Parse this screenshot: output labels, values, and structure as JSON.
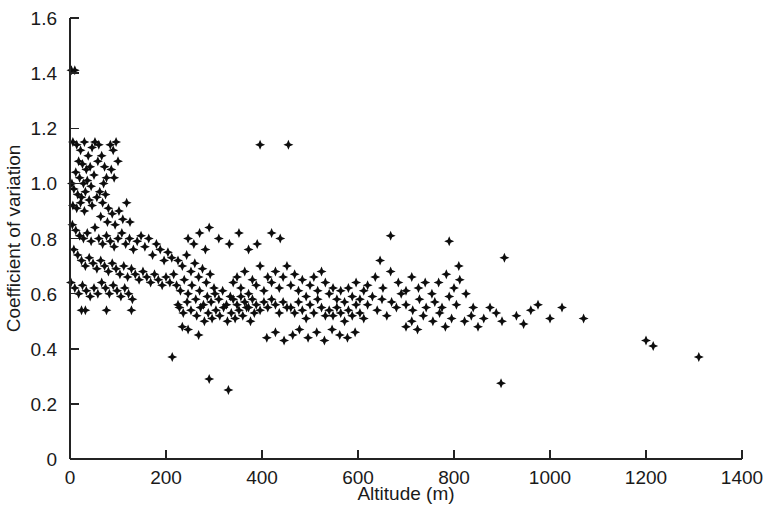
{
  "chart_data": {
    "type": "scatter",
    "title": "",
    "xlabel": "Altitude (m)",
    "ylabel": "Coefficient of variation",
    "xlim": [
      0,
      1400
    ],
    "ylim": [
      0,
      1.6
    ],
    "xticks": [
      0,
      200,
      400,
      600,
      800,
      1000,
      1200,
      1400
    ],
    "xtick_labels": [
      "0",
      "200",
      "400",
      "600",
      "800",
      "1000",
      "1200",
      "1400"
    ],
    "yticks": [
      0,
      0.2,
      0.4,
      0.6,
      0.8,
      1.0,
      1.2,
      1.4,
      1.6
    ],
    "ytick_labels": [
      "0",
      "0.2",
      "0.4",
      "0.6",
      "0.8",
      "1.0",
      "1.2",
      "1.4",
      "1.6"
    ],
    "grid": false,
    "legend": null,
    "marker": "diamond",
    "marker_color": "#0d0d0d",
    "marker_size": 9,
    "n_points": 330,
    "points": [
      [
        3,
        1.41
      ],
      [
        10,
        1.41
      ],
      [
        6,
        1.15
      ],
      [
        14,
        1.14
      ],
      [
        22,
        1.12
      ],
      [
        30,
        1.15
      ],
      [
        38,
        1.1
      ],
      [
        46,
        1.13
      ],
      [
        52,
        1.15
      ],
      [
        60,
        1.14
      ],
      [
        18,
        1.08
      ],
      [
        26,
        1.07
      ],
      [
        34,
        1.05
      ],
      [
        42,
        1.06
      ],
      [
        12,
        1.04
      ],
      [
        20,
        1.02
      ],
      [
        28,
        1.0
      ],
      [
        36,
        1.01
      ],
      [
        44,
        0.99
      ],
      [
        50,
        1.03
      ],
      [
        4,
        1.0
      ],
      [
        8,
        0.98
      ],
      [
        16,
        0.96
      ],
      [
        24,
        0.95
      ],
      [
        32,
        0.97
      ],
      [
        40,
        0.94
      ],
      [
        6,
        0.92
      ],
      [
        14,
        0.91
      ],
      [
        22,
        0.93
      ],
      [
        30,
        0.9
      ],
      [
        46,
        0.92
      ],
      [
        56,
        0.95
      ],
      [
        62,
        0.97
      ],
      [
        68,
        0.93
      ],
      [
        74,
        0.96
      ],
      [
        80,
        0.91
      ],
      [
        70,
        1.0
      ],
      [
        76,
        1.02
      ],
      [
        58,
        1.08
      ],
      [
        66,
        1.1
      ],
      [
        72,
        1.06
      ],
      [
        84,
        1.14
      ],
      [
        90,
        1.12
      ],
      [
        96,
        1.15
      ],
      [
        86,
        1.05
      ],
      [
        92,
        1.02
      ],
      [
        100,
        1.08
      ],
      [
        64,
        0.88
      ],
      [
        78,
        0.86
      ],
      [
        88,
        0.89
      ],
      [
        94,
        0.85
      ],
      [
        102,
        0.9
      ],
      [
        110,
        0.87
      ],
      [
        118,
        0.93
      ],
      [
        125,
        0.86
      ],
      [
        5,
        0.85
      ],
      [
        12,
        0.83
      ],
      [
        20,
        0.81
      ],
      [
        28,
        0.8
      ],
      [
        36,
        0.82
      ],
      [
        44,
        0.79
      ],
      [
        52,
        0.84
      ],
      [
        60,
        0.8
      ],
      [
        68,
        0.78
      ],
      [
        76,
        0.81
      ],
      [
        84,
        0.79
      ],
      [
        92,
        0.77
      ],
      [
        100,
        0.8
      ],
      [
        108,
        0.82
      ],
      [
        116,
        0.78
      ],
      [
        124,
        0.8
      ],
      [
        132,
        0.76
      ],
      [
        140,
        0.79
      ],
      [
        148,
        0.81
      ],
      [
        156,
        0.77
      ],
      [
        164,
        0.8
      ],
      [
        172,
        0.74
      ],
      [
        180,
        0.78
      ],
      [
        188,
        0.76
      ],
      [
        196,
        0.72
      ],
      [
        204,
        0.75
      ],
      [
        212,
        0.73
      ],
      [
        8,
        0.76
      ],
      [
        16,
        0.74
      ],
      [
        24,
        0.72
      ],
      [
        32,
        0.7
      ],
      [
        40,
        0.73
      ],
      [
        48,
        0.71
      ],
      [
        56,
        0.69
      ],
      [
        64,
        0.72
      ],
      [
        72,
        0.7
      ],
      [
        80,
        0.68
      ],
      [
        88,
        0.71
      ],
      [
        96,
        0.69
      ],
      [
        104,
        0.67
      ],
      [
        112,
        0.7
      ],
      [
        120,
        0.66
      ],
      [
        128,
        0.69
      ],
      [
        136,
        0.67
      ],
      [
        144,
        0.65
      ],
      [
        152,
        0.68
      ],
      [
        160,
        0.66
      ],
      [
        168,
        0.64
      ],
      [
        176,
        0.67
      ],
      [
        184,
        0.65
      ],
      [
        192,
        0.63
      ],
      [
        200,
        0.66
      ],
      [
        208,
        0.64
      ],
      [
        216,
        0.67
      ],
      [
        2,
        0.64
      ],
      [
        10,
        0.62
      ],
      [
        18,
        0.6
      ],
      [
        26,
        0.63
      ],
      [
        34,
        0.61
      ],
      [
        42,
        0.59
      ],
      [
        50,
        0.62
      ],
      [
        58,
        0.6
      ],
      [
        66,
        0.64
      ],
      [
        74,
        0.62
      ],
      [
        82,
        0.6
      ],
      [
        90,
        0.63
      ],
      [
        98,
        0.61
      ],
      [
        106,
        0.59
      ],
      [
        114,
        0.62
      ],
      [
        122,
        0.6
      ],
      [
        130,
        0.58
      ],
      [
        24,
        0.54
      ],
      [
        32,
        0.54
      ],
      [
        76,
        0.54
      ],
      [
        128,
        0.54
      ],
      [
        213,
        0.37
      ],
      [
        225,
        0.72
      ],
      [
        234,
        0.7
      ],
      [
        243,
        0.74
      ],
      [
        252,
        0.68
      ],
      [
        260,
        0.71
      ],
      [
        268,
        0.66
      ],
      [
        276,
        0.69
      ],
      [
        284,
        0.64
      ],
      [
        292,
        0.67
      ],
      [
        300,
        0.62
      ],
      [
        222,
        0.63
      ],
      [
        230,
        0.61
      ],
      [
        238,
        0.65
      ],
      [
        246,
        0.6
      ],
      [
        254,
        0.63
      ],
      [
        262,
        0.58
      ],
      [
        270,
        0.61
      ],
      [
        278,
        0.56
      ],
      [
        286,
        0.59
      ],
      [
        294,
        0.57
      ],
      [
        302,
        0.6
      ],
      [
        310,
        0.58
      ],
      [
        318,
        0.61
      ],
      [
        326,
        0.56
      ],
      [
        334,
        0.59
      ],
      [
        228,
        0.55
      ],
      [
        236,
        0.53
      ],
      [
        244,
        0.57
      ],
      [
        252,
        0.54
      ],
      [
        264,
        0.52
      ],
      [
        272,
        0.55
      ],
      [
        280,
        0.5
      ],
      [
        288,
        0.53
      ],
      [
        296,
        0.51
      ],
      [
        304,
        0.54
      ],
      [
        312,
        0.52
      ],
      [
        320,
        0.55
      ],
      [
        328,
        0.5
      ],
      [
        336,
        0.53
      ],
      [
        344,
        0.51
      ],
      [
        352,
        0.54
      ],
      [
        360,
        0.52
      ],
      [
        368,
        0.55
      ],
      [
        376,
        0.5
      ],
      [
        384,
        0.53
      ],
      [
        340,
        0.64
      ],
      [
        348,
        0.66
      ],
      [
        356,
        0.62
      ],
      [
        364,
        0.68
      ],
      [
        372,
        0.6
      ],
      [
        380,
        0.65
      ],
      [
        388,
        0.63
      ],
      [
        396,
        0.7
      ],
      [
        404,
        0.61
      ],
      [
        412,
        0.66
      ],
      [
        340,
        0.58
      ],
      [
        348,
        0.56
      ],
      [
        356,
        0.59
      ],
      [
        364,
        0.57
      ],
      [
        372,
        0.55
      ],
      [
        380,
        0.58
      ],
      [
        388,
        0.56
      ],
      [
        396,
        0.54
      ],
      [
        404,
        0.57
      ],
      [
        412,
        0.55
      ],
      [
        420,
        0.58
      ],
      [
        428,
        0.56
      ],
      [
        436,
        0.53
      ],
      [
        444,
        0.57
      ],
      [
        452,
        0.55
      ],
      [
        420,
        0.64
      ],
      [
        428,
        0.68
      ],
      [
        436,
        0.62
      ],
      [
        444,
        0.66
      ],
      [
        452,
        0.7
      ],
      [
        460,
        0.63
      ],
      [
        468,
        0.67
      ],
      [
        476,
        0.61
      ],
      [
        484,
        0.65
      ],
      [
        492,
        0.59
      ],
      [
        460,
        0.55
      ],
      [
        468,
        0.53
      ],
      [
        476,
        0.57
      ],
      [
        484,
        0.54
      ],
      [
        492,
        0.51
      ],
      [
        500,
        0.56
      ],
      [
        508,
        0.53
      ],
      [
        516,
        0.58
      ],
      [
        524,
        0.55
      ],
      [
        532,
        0.52
      ],
      [
        500,
        0.63
      ],
      [
        508,
        0.66
      ],
      [
        516,
        0.61
      ],
      [
        524,
        0.68
      ],
      [
        532,
        0.64
      ],
      [
        540,
        0.6
      ],
      [
        548,
        0.62
      ],
      [
        556,
        0.58
      ],
      [
        564,
        0.61
      ],
      [
        572,
        0.57
      ],
      [
        540,
        0.54
      ],
      [
        548,
        0.52
      ],
      [
        556,
        0.55
      ],
      [
        564,
        0.53
      ],
      [
        572,
        0.5
      ],
      [
        580,
        0.54
      ],
      [
        588,
        0.52
      ],
      [
        596,
        0.56
      ],
      [
        604,
        0.53
      ],
      [
        612,
        0.51
      ],
      [
        580,
        0.62
      ],
      [
        588,
        0.59
      ],
      [
        596,
        0.64
      ],
      [
        604,
        0.58
      ],
      [
        612,
        0.61
      ],
      [
        396,
        1.14
      ],
      [
        455,
        1.14
      ],
      [
        420,
        0.82
      ],
      [
        438,
        0.8
      ],
      [
        390,
        0.78
      ],
      [
        372,
        0.76
      ],
      [
        290,
        0.84
      ],
      [
        310,
        0.8
      ],
      [
        332,
        0.78
      ],
      [
        352,
        0.82
      ],
      [
        246,
        0.8
      ],
      [
        258,
        0.78
      ],
      [
        270,
        0.82
      ],
      [
        282,
        0.76
      ],
      [
        225,
        0.56
      ],
      [
        234,
        0.48
      ],
      [
        246,
        0.47
      ],
      [
        268,
        0.45
      ],
      [
        290,
        0.29
      ],
      [
        330,
        0.25
      ],
      [
        410,
        0.44
      ],
      [
        428,
        0.46
      ],
      [
        446,
        0.43
      ],
      [
        464,
        0.45
      ],
      [
        478,
        0.47
      ],
      [
        496,
        0.44
      ],
      [
        514,
        0.46
      ],
      [
        530,
        0.43
      ],
      [
        546,
        0.47
      ],
      [
        562,
        0.45
      ],
      [
        578,
        0.44
      ],
      [
        594,
        0.46
      ],
      [
        620,
        0.56
      ],
      [
        630,
        0.59
      ],
      [
        640,
        0.54
      ],
      [
        650,
        0.58
      ],
      [
        660,
        0.52
      ],
      [
        670,
        0.57
      ],
      [
        680,
        0.55
      ],
      [
        690,
        0.6
      ],
      [
        620,
        0.63
      ],
      [
        636,
        0.66
      ],
      [
        652,
        0.62
      ],
      [
        668,
        0.68
      ],
      [
        684,
        0.64
      ],
      [
        700,
        0.61
      ],
      [
        668,
        0.81
      ],
      [
        646,
        0.72
      ],
      [
        700,
        0.48
      ],
      [
        712,
        0.5
      ],
      [
        724,
        0.47
      ],
      [
        736,
        0.52
      ],
      [
        700,
        0.56
      ],
      [
        714,
        0.54
      ],
      [
        728,
        0.58
      ],
      [
        742,
        0.55
      ],
      [
        712,
        0.66
      ],
      [
        726,
        0.62
      ],
      [
        740,
        0.64
      ],
      [
        754,
        0.6
      ],
      [
        756,
        0.5
      ],
      [
        770,
        0.53
      ],
      [
        782,
        0.48
      ],
      [
        795,
        0.51
      ],
      [
        760,
        0.57
      ],
      [
        775,
        0.55
      ],
      [
        790,
        0.59
      ],
      [
        805,
        0.56
      ],
      [
        768,
        0.64
      ],
      [
        784,
        0.67
      ],
      [
        800,
        0.62
      ],
      [
        812,
        0.65
      ],
      [
        790,
        0.79
      ],
      [
        810,
        0.7
      ],
      [
        825,
        0.6
      ],
      [
        840,
        0.55
      ],
      [
        822,
        0.5
      ],
      [
        836,
        0.52
      ],
      [
        850,
        0.48
      ],
      [
        862,
        0.51
      ],
      [
        875,
        0.55
      ],
      [
        888,
        0.53
      ],
      [
        900,
        0.5
      ],
      [
        905,
        0.73
      ],
      [
        898,
        0.275
      ],
      [
        930,
        0.52
      ],
      [
        945,
        0.49
      ],
      [
        960,
        0.54
      ],
      [
        975,
        0.56
      ],
      [
        1000,
        0.51
      ],
      [
        1025,
        0.55
      ],
      [
        1070,
        0.51
      ],
      [
        1200,
        0.43
      ],
      [
        1215,
        0.41
      ],
      [
        1310,
        0.37
      ]
    ]
  },
  "axes": {
    "xtitle": "Altitude (m)",
    "ytitle": "Coefficient of variation"
  }
}
